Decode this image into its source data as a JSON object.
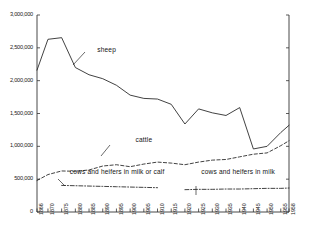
{
  "chart_data": {
    "type": "line",
    "title": "",
    "subtitle": "",
    "xlabel": "",
    "ylabel": "",
    "xlim": [
      1866,
      1958
    ],
    "ylim": [
      0,
      3000000
    ],
    "grid": false,
    "legend_position": "inline-annotations",
    "y_ticks": [
      {
        "value": 3000000,
        "label": "3,000,000"
      },
      {
        "value": 2500000,
        "label": "2,500,000"
      },
      {
        "value": 2000000,
        "label": "2,000,000"
      },
      {
        "value": 1500000,
        "label": "1,500,000"
      },
      {
        "value": 1000000,
        "label": "1,000,000"
      },
      {
        "value": 500000,
        "label": "500,000"
      },
      {
        "value": 0,
        "label": "0"
      }
    ],
    "x_ticks": [
      {
        "value": 1866,
        "label": "1866"
      },
      {
        "value": 1870,
        "label": "1870"
      },
      {
        "value": 1875,
        "label": "1875"
      },
      {
        "value": 1880,
        "label": "1880"
      },
      {
        "value": 1885,
        "label": "1885"
      },
      {
        "value": 1890,
        "label": "1890"
      },
      {
        "value": 1895,
        "label": "1895"
      },
      {
        "value": 1900,
        "label": "1900"
      },
      {
        "value": 1905,
        "label": "1905"
      },
      {
        "value": 1910,
        "label": "1910"
      },
      {
        "value": 1915,
        "label": "1915"
      },
      {
        "value": 1920,
        "label": "1920"
      },
      {
        "value": 1925,
        "label": "1925"
      },
      {
        "value": 1930,
        "label": "1930"
      },
      {
        "value": 1935,
        "label": "1935"
      },
      {
        "value": 1940,
        "label": "1940"
      },
      {
        "value": 1945,
        "label": "1945"
      },
      {
        "value": 1950,
        "label": "1950"
      },
      {
        "value": 1955,
        "label": "1955"
      },
      {
        "value": 1958,
        "label": "1958"
      }
    ],
    "series": [
      {
        "name": "sheep",
        "label": "sheep",
        "style": "solid",
        "color": "#202020",
        "x": [
          1866,
          1870,
          1875,
          1880,
          1885,
          1890,
          1895,
          1900,
          1905,
          1910,
          1915,
          1920,
          1925,
          1930,
          1935,
          1940,
          1945,
          1950,
          1955,
          1958
        ],
        "values": [
          2160000,
          2630000,
          2655000,
          2200000,
          2090000,
          2030000,
          1930000,
          1780000,
          1730000,
          1720000,
          1640000,
          1340000,
          1570000,
          1510000,
          1470000,
          1590000,
          960000,
          1000000,
          1210000,
          1320000
        ]
      },
      {
        "name": "cattle",
        "label": "cattle",
        "style": "dashed",
        "color": "#202020",
        "x": [
          1866,
          1870,
          1875,
          1880,
          1885,
          1890,
          1895,
          1900,
          1905,
          1910,
          1915,
          1920,
          1925,
          1930,
          1935,
          1940,
          1945,
          1950,
          1955,
          1958
        ],
        "values": [
          480000,
          570000,
          625000,
          620000,
          640000,
          700000,
          720000,
          690000,
          730000,
          760000,
          745000,
          720000,
          760000,
          790000,
          800000,
          840000,
          880000,
          900000,
          1010000,
          1085000
        ]
      },
      {
        "name": "cows-and-heifers-in-milk-or-calf",
        "label": "cows and heifers in milk or calf",
        "style": "dashdot",
        "color": "#202020",
        "x": [
          1875,
          1880,
          1885,
          1890,
          1895,
          1900,
          1905,
          1910
        ],
        "values": [
          405000,
          400000,
          395000,
          390000,
          385000,
          380000,
          375000,
          370000
        ]
      },
      {
        "name": "cows-and-heifers-in-milk",
        "label": "cows and heifers in milk",
        "style": "dashdot",
        "color": "#202020",
        "x": [
          1920,
          1925,
          1930,
          1935,
          1940,
          1945,
          1950,
          1955,
          1958
        ],
        "values": [
          340000,
          345000,
          345000,
          350000,
          350000,
          355000,
          360000,
          360000,
          365000
        ]
      }
    ],
    "annotations": [
      {
        "name": "sheep-annotation",
        "text": "sheep",
        "x": 1888,
        "y": 2450000
      },
      {
        "name": "cattle-annotation",
        "text": "cattle",
        "x": 1902,
        "y": 1080000
      },
      {
        "name": "cows-in-milk-or-calf-annotation",
        "text": "cows and heifers in milk or calf",
        "x": 1878,
        "y": 600000
      },
      {
        "name": "cows-in-milk-annotation",
        "text": "cows and heifers in milk",
        "x": 1926,
        "y": 600000
      }
    ]
  }
}
